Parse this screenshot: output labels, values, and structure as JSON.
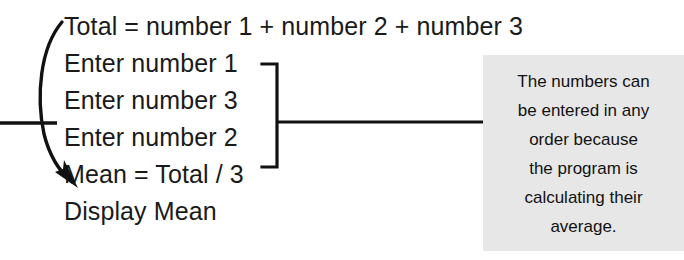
{
  "figure": {
    "kind": "annotated-pseudocode-diagram",
    "background_color": "#ffffff",
    "text_color": "#1a1a1a"
  },
  "pseudocode": {
    "lines": [
      {
        "text": "Total = number 1 + number 2 + number 3"
      },
      {
        "text": "Enter number 1"
      },
      {
        "text": "Enter number 3"
      },
      {
        "text": "Enter number 2"
      },
      {
        "text": "Mean = Total / 3"
      },
      {
        "text": "Display Mean"
      }
    ]
  },
  "annotation": {
    "background_color": "#e7e7e7",
    "text_color": "#121212",
    "lines": [
      "The numbers can",
      "be entered in any",
      "order because",
      "the program is",
      "calculating their",
      "average."
    ]
  },
  "markers": {
    "curved_arrow": {
      "name": "curved-arrow-marker",
      "color": "#111111",
      "spans_lines": "Total = number 1 + number 2 + number 3 through Mean = Total / 3"
    },
    "left_leader": {
      "name": "left-leader-line",
      "color": "#111111"
    },
    "group_bracket": {
      "name": "group-bracket-marker",
      "color": "#111111",
      "groups_lines": "Enter number 1, Enter number 3, Enter number 2"
    },
    "right_leader": {
      "name": "right-leader-line",
      "color": "#111111"
    }
  }
}
